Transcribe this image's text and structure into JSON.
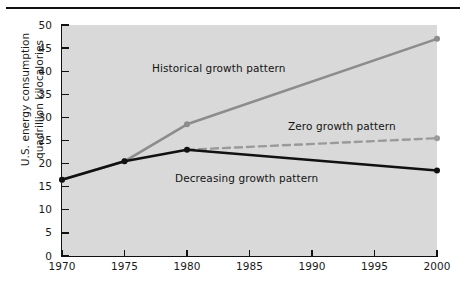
{
  "figure": {
    "background_color": "#ffffff",
    "panel_color": "#d9d9d9",
    "rule_color": "#111111"
  },
  "chart_data": {
    "type": "line",
    "title": "",
    "xlabel": "",
    "ylabel": "U.S. energy consumption quadrillion kilocalories",
    "x": [
      1970,
      1975,
      1980,
      1985,
      1990,
      1995,
      2000
    ],
    "xlim": [
      1970,
      2000
    ],
    "ylim": [
      0,
      50
    ],
    "xticks": [
      1970,
      1975,
      1980,
      1985,
      1990,
      1995,
      2000
    ],
    "yticks": [
      0,
      5,
      10,
      15,
      20,
      25,
      30,
      35,
      40,
      45,
      50
    ],
    "xtick_labels": [
      "1970",
      "1975",
      "1980",
      "1985",
      "1990",
      "1995",
      "2000"
    ],
    "ytick_labels": [
      "0",
      "5",
      "10",
      "15",
      "20",
      "25",
      "30",
      "35",
      "40",
      "45",
      "50"
    ],
    "grid": false,
    "legend_position": "inline-annotations",
    "series": [
      {
        "name": "Historical growth pattern",
        "color": "#8c8c8c",
        "style": "solid",
        "width": 2.6,
        "markers": [
          1970,
          1975,
          1980,
          2000
        ],
        "x": [
          1970,
          1975,
          1980,
          2000
        ],
        "values": [
          16.5,
          20.5,
          28.5,
          47.0
        ]
      },
      {
        "name": "Zero growth pattern",
        "color": "#9a9a9a",
        "style": "dashed",
        "width": 2.4,
        "markers": [
          2000
        ],
        "x": [
          1980,
          2000
        ],
        "values": [
          23.0,
          25.5
        ]
      },
      {
        "name": "Decreasing growth pattern",
        "color": "#111111",
        "style": "solid",
        "width": 2.6,
        "markers": [
          1970,
          1975,
          1980,
          2000
        ],
        "x": [
          1970,
          1975,
          1980,
          2000
        ],
        "values": [
          16.5,
          20.5,
          23.0,
          18.5
        ]
      }
    ],
    "annotations": [
      {
        "text": "Historical growth pattern",
        "series": "Historical growth pattern"
      },
      {
        "text": "Zero growth pattern",
        "series": "Zero growth pattern"
      },
      {
        "text": "Decreasing growth pattern",
        "series": "Decreasing growth pattern"
      }
    ]
  }
}
